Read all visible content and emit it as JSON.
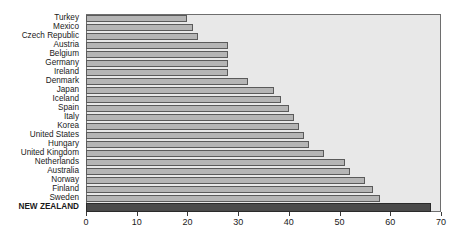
{
  "chart_data": {
    "type": "bar",
    "orientation": "horizontal",
    "title": "",
    "subtitle": "",
    "xlabel": "",
    "ylabel": "",
    "xlim": [
      0,
      70
    ],
    "xticks": [
      0,
      10,
      20,
      30,
      40,
      50,
      60,
      70
    ],
    "xticklabels": [
      "0",
      "10",
      "20",
      "30",
      "40",
      "50",
      "60",
      "70"
    ],
    "grid": false,
    "legend": null,
    "categories": [
      "Turkey",
      "Mexico",
      "Czech Republic",
      "Austria",
      "Belgium",
      "Germany",
      "Ireland",
      "Denmark",
      "Japan",
      "Iceland",
      "Spain",
      "Italy",
      "Korea",
      "United States",
      "Hungary",
      "United Kingdom",
      "Netherlands",
      "Australia",
      "Norway",
      "Finland",
      "Sweden",
      "NEW ZEALAND"
    ],
    "values": [
      20,
      21,
      22,
      28,
      28,
      28,
      28,
      32,
      37,
      38.5,
      40,
      41,
      42,
      43,
      44,
      47,
      51,
      52,
      55,
      56.5,
      58,
      68
    ],
    "highlight_category": "NEW ZEALAND",
    "colors": {
      "bar_fill": "#b5b5b5",
      "bar_border": "#5a5a5a",
      "highlight_fill": "#4a4a4a",
      "highlight_border": "#2a2a2a",
      "plot_background": "#e8e8e8",
      "plot_border": "#6e6e6e",
      "page_background": "#ffffff",
      "text": "#1a1a1a"
    }
  }
}
